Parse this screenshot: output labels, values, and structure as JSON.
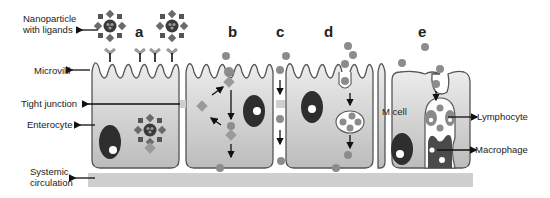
{
  "diagram": {
    "labels": {
      "nanoparticle": [
        "Nanoparticle",
        "with ligands"
      ],
      "microvilli": "Microvilli",
      "tight_junction": "Tight junction",
      "enterocyte": "Enterocyte",
      "systemic": [
        "Systemic",
        "circulation"
      ],
      "m_cell": "M cell",
      "lymphocyte": "Lymphocyte",
      "macrophage": "Macrophage"
    },
    "panels": [
      "a",
      "b",
      "c",
      "d",
      "e"
    ],
    "colors": {
      "cell_fill_top": "#e6e6e6",
      "cell_fill_bottom": "#bdbdbd",
      "nucleus": "#2e2e2e",
      "particle": "#8c8c8c",
      "ligand": "#9a9a9a",
      "circulation_bar": "#cfcfcf",
      "text": "#222222"
    }
  }
}
